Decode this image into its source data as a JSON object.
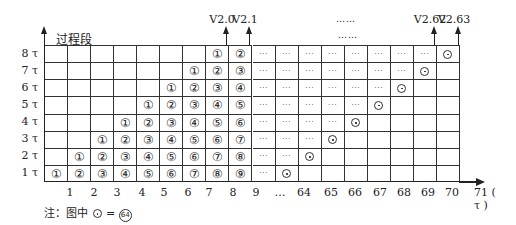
{
  "title": "过程段",
  "y_labels": [
    "8 τ",
    "7 τ",
    "6 τ",
    "5 τ",
    "4 τ",
    "3 τ",
    "2 τ",
    "1 τ"
  ],
  "x_labels": [
    {
      "text": "1",
      "x": 70
    },
    {
      "text": "2",
      "x": 94
    },
    {
      "text": "3",
      "x": 117
    },
    {
      "text": "4",
      "x": 142
    },
    {
      "text": "5",
      "x": 164
    },
    {
      "text": "6",
      "x": 188
    },
    {
      "text": "7",
      "x": 209
    },
    {
      "text": "8",
      "x": 233
    },
    {
      "text": "9",
      "x": 256
    },
    {
      "text": "…",
      "x": 280
    },
    {
      "text": "64",
      "x": 304
    },
    {
      "text": "65",
      "x": 331
    },
    {
      "text": "66",
      "x": 355
    },
    {
      "text": "67",
      "x": 380
    },
    {
      "text": "68",
      "x": 404
    },
    {
      "text": "69",
      "x": 428
    },
    {
      "text": "70",
      "x": 452
    },
    {
      "text": "71 ( τ )",
      "x": 488
    }
  ],
  "versions": [
    {
      "label": "V2.0",
      "x": 226
    },
    {
      "label": "V2.1",
      "x": 249
    },
    {
      "label": "V2.62",
      "x": 434
    },
    {
      "label": "V2.63",
      "x": 458
    }
  ],
  "ellipsis_top": "……",
  "ellipsis_mid": "……",
  "note": "注：图中⊙=㉔",
  "note_prefix": "注：图中",
  "note_eq": "=",
  "note_value": "64",
  "grid": {
    "columns": 18,
    "rows": [
      [
        "",
        "",
        "",
        "",
        "",
        "",
        "",
        "①",
        "②",
        "…",
        "…",
        "…",
        "…",
        "…",
        "…",
        "…",
        "…",
        "⊙"
      ],
      [
        "",
        "",
        "",
        "",
        "",
        "",
        "①",
        "②",
        "③",
        "…",
        "…",
        "…",
        "…",
        "…",
        "…",
        "…",
        "⊙",
        ""
      ],
      [
        "",
        "",
        "",
        "",
        "",
        "①",
        "②",
        "③",
        "④",
        "…",
        "…",
        "…",
        "…",
        "…",
        "…",
        "⊙",
        "",
        ""
      ],
      [
        "",
        "",
        "",
        "",
        "①",
        "②",
        "③",
        "④",
        "⑤",
        "…",
        "…",
        "…",
        "…",
        "…",
        "⊙",
        "",
        "",
        ""
      ],
      [
        "",
        "",
        "",
        "①",
        "②",
        "③",
        "④",
        "⑤",
        "⑥",
        "…",
        "…",
        "…",
        "…",
        "⊙",
        "",
        "",
        "",
        ""
      ],
      [
        "",
        "",
        "①",
        "②",
        "③",
        "④",
        "⑤",
        "⑥",
        "⑦",
        "…",
        "…",
        "…",
        "⊙",
        "",
        "",
        "",
        "",
        ""
      ],
      [
        "",
        "①",
        "②",
        "③",
        "④",
        "⑤",
        "⑥",
        "⑦",
        "⑧",
        "…",
        "…",
        "⊙",
        "",
        "",
        "",
        "",
        "",
        ""
      ],
      [
        "①",
        "②",
        "③",
        "④",
        "⑤",
        "⑥",
        "⑦",
        "⑧",
        "⑨",
        "…",
        "⊙",
        "",
        "",
        "",
        "",
        "",
        "",
        ""
      ]
    ]
  }
}
